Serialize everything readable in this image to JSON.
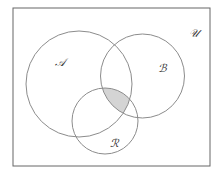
{
  "diagram": {
    "type": "venn",
    "universe": {
      "label": "𝒰",
      "rect": {
        "x": 13,
        "y": 8,
        "width": 197,
        "height": 158
      },
      "label_pos": {
        "x": 189,
        "y": 37
      }
    },
    "sets": [
      {
        "name": "A",
        "label": "𝒜",
        "cx": 79,
        "cy": 84,
        "r": 53,
        "label_pos": {
          "x": 55,
          "y": 66
        }
      },
      {
        "name": "B",
        "label": "ℬ",
        "cx": 142.5,
        "cy": 76,
        "r": 42,
        "label_pos": {
          "x": 158,
          "y": 72
        }
      },
      {
        "name": "R",
        "label": "ℛ",
        "cx": 105,
        "cy": 121,
        "r": 33,
        "label_pos": {
          "x": 110,
          "y": 147
        }
      }
    ],
    "shaded_region": "A ∩ B ∩ R",
    "colors": {
      "stroke": "#8c8c8c",
      "border": "#666666",
      "shade": "#d4d4d4",
      "background": "#ffffff"
    }
  }
}
